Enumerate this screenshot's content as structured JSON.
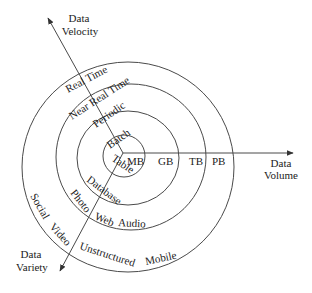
{
  "diagram": {
    "axes": {
      "velocity": {
        "line1": "Data",
        "line2": "Velocity"
      },
      "volume": {
        "line1": "Data",
        "line2": "Volume"
      },
      "variety": {
        "line1": "Data",
        "line2": "Variety"
      }
    },
    "rings": [
      {
        "level": 1,
        "velocity": "Batch",
        "volume": "MB",
        "variety": "Table"
      },
      {
        "level": 2,
        "velocity": "Periodic",
        "volume": "GB",
        "variety": "Database"
      },
      {
        "level": 3,
        "velocity": "Near Real Time",
        "volume": "TB",
        "variety_items": [
          "Photo",
          "Web",
          "Audio"
        ]
      },
      {
        "level": 4,
        "velocity": "Real Time",
        "volume": "PB",
        "variety_items": [
          "Social",
          "Video",
          "Unstructured",
          "Mobile"
        ]
      }
    ],
    "colors": {
      "stroke": "#4a4a4a",
      "text": "#222222",
      "background": "#ffffff"
    }
  }
}
